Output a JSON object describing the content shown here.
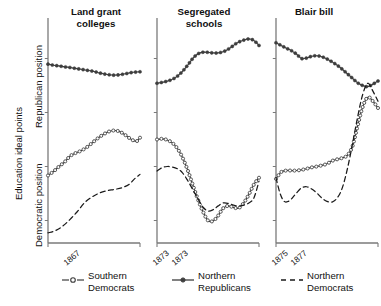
{
  "axis": {
    "outer_ylabel": "Education ideal points",
    "upper_ylabel": "Republican position",
    "lower_ylabel": "Democratic position"
  },
  "legend": {
    "items": [
      {
        "label": "Southern\nDemocrats",
        "style": "line-open-circle",
        "color": "#3d3d3d"
      },
      {
        "label": "Northern\nRepublicans",
        "style": "line-filled-circle",
        "color": "#3d3d3d"
      },
      {
        "label": "Northern\nDemocrats",
        "style": "dashed",
        "color": "#1a1a1a"
      }
    ]
  },
  "panels": [
    {
      "title": "Land grant\ncolleges",
      "xticks": [
        "1867",
        "1873"
      ]
    },
    {
      "title": "Segregated\nschools",
      "xticks": [
        "1873",
        "1875"
      ]
    },
    {
      "title": "Blair bill",
      "xticks": [
        "1877",
        "1890"
      ]
    }
  ],
  "chart_data": {
    "type": "line",
    "title": "",
    "subtitle": "",
    "xlabel": "",
    "ylabel": "Education ideal points",
    "ylim": [
      0,
      1
    ],
    "grid": false,
    "legend_position": "bottom",
    "panel_layout": "1x3 small multiples",
    "y_axis_note": "Upper half labeled 'Republican position', lower half labeled 'Democratic position'; no numeric tick labels shown",
    "panels": [
      {
        "name": "Land grant colleges",
        "xlim": [
          "1867",
          "1873"
        ],
        "xticks": [
          "1867",
          "1873"
        ],
        "series": [
          {
            "name": "Northern Republicans",
            "style": "line-filled-circle",
            "x": [
              0,
              0.06,
              0.12,
              0.18,
              0.24,
              0.3,
              0.36,
              0.42,
              0.48,
              0.54,
              0.6,
              0.66,
              0.72,
              0.78,
              0.84,
              0.9,
              0.96,
              1
            ],
            "values": [
              0.795,
              0.79,
              0.787,
              0.783,
              0.78,
              0.776,
              0.772,
              0.768,
              0.764,
              0.758,
              0.752,
              0.748,
              0.746,
              0.748,
              0.752,
              0.757,
              0.76,
              0.761
            ]
          },
          {
            "name": "Southern Democrats",
            "style": "line-open-circle",
            "x": [
              0,
              0.06,
              0.12,
              0.18,
              0.24,
              0.3,
              0.36,
              0.42,
              0.48,
              0.54,
              0.6,
              0.66,
              0.72,
              0.78,
              0.84,
              0.9,
              0.96,
              1
            ],
            "values": [
              0.3,
              0.318,
              0.34,
              0.36,
              0.386,
              0.4,
              0.41,
              0.425,
              0.445,
              0.465,
              0.482,
              0.495,
              0.5,
              0.495,
              0.48,
              0.462,
              0.452,
              0.468
            ]
          },
          {
            "name": "Northern Democrats",
            "style": "dashed",
            "x": [
              0,
              0.08,
              0.16,
              0.24,
              0.32,
              0.4,
              0.48,
              0.56,
              0.64,
              0.72,
              0.8,
              0.88,
              0.94,
              1
            ],
            "values": [
              0.045,
              0.055,
              0.075,
              0.105,
              0.14,
              0.18,
              0.205,
              0.222,
              0.232,
              0.238,
              0.245,
              0.26,
              0.285,
              0.305
            ]
          }
        ]
      },
      {
        "name": "Segregated schools",
        "xlim": [
          "1873",
          "1875"
        ],
        "xticks": [
          "1873",
          "1875"
        ],
        "series": [
          {
            "name": "Northern Republicans",
            "style": "line-filled-circle",
            "x": [
              0,
              0.06,
              0.12,
              0.18,
              0.24,
              0.3,
              0.36,
              0.42,
              0.48,
              0.54,
              0.6,
              0.66,
              0.72,
              0.78,
              0.84,
              0.9,
              0.95,
              1
            ],
            "values": [
              0.71,
              0.715,
              0.722,
              0.735,
              0.758,
              0.79,
              0.825,
              0.845,
              0.848,
              0.845,
              0.845,
              0.852,
              0.868,
              0.888,
              0.9,
              0.907,
              0.9,
              0.878
            ]
          },
          {
            "name": "Southern Democrats",
            "style": "line-open-circle",
            "x": [
              0,
              0.05,
              0.1,
              0.15,
              0.2,
              0.25,
              0.3,
              0.35,
              0.4,
              0.45,
              0.5,
              0.55,
              0.6,
              0.65,
              0.7,
              0.75,
              0.8,
              0.85,
              0.9,
              0.95,
              1
            ],
            "values": [
              0.46,
              0.463,
              0.458,
              0.445,
              0.42,
              0.38,
              0.325,
              0.26,
              0.195,
              0.14,
              0.1,
              0.098,
              0.122,
              0.155,
              0.165,
              0.158,
              0.155,
              0.178,
              0.215,
              0.26,
              0.29
            ]
          },
          {
            "name": "Northern Democrats",
            "style": "dashed",
            "x": [
              0,
              0.05,
              0.1,
              0.15,
              0.2,
              0.25,
              0.3,
              0.35,
              0.4,
              0.45,
              0.5,
              0.55,
              0.6,
              0.65,
              0.7,
              0.75,
              0.8,
              0.85,
              0.9,
              0.95,
              1
            ],
            "values": [
              0.32,
              0.335,
              0.34,
              0.338,
              0.33,
              0.312,
              0.278,
              0.238,
              0.198,
              0.16,
              0.142,
              0.148,
              0.165,
              0.178,
              0.176,
              0.168,
              0.164,
              0.168,
              0.178,
              0.2,
              0.275
            ]
          }
        ]
      },
      {
        "name": "Blair bill",
        "xlim": [
          "1877",
          "1890"
        ],
        "xticks": [
          "1877",
          "1890"
        ],
        "series": [
          {
            "name": "Northern Republicans",
            "style": "line-filled-circle",
            "x": [
              0,
              0.05,
              0.1,
              0.15,
              0.2,
              0.25,
              0.3,
              0.35,
              0.4,
              0.45,
              0.5,
              0.55,
              0.6,
              0.65,
              0.7,
              0.75,
              0.8,
              0.85,
              0.9,
              0.95,
              1
            ],
            "values": [
              0.89,
              0.878,
              0.866,
              0.855,
              0.84,
              0.82,
              0.822,
              0.83,
              0.832,
              0.828,
              0.818,
              0.805,
              0.79,
              0.772,
              0.752,
              0.732,
              0.712,
              0.7,
              0.695,
              0.706,
              0.72
            ]
          },
          {
            "name": "Southern Democrats",
            "style": "line-open-circle",
            "x": [
              0,
              0.05,
              0.1,
              0.15,
              0.2,
              0.25,
              0.3,
              0.35,
              0.4,
              0.45,
              0.5,
              0.55,
              0.6,
              0.65,
              0.7,
              0.75,
              0.8,
              0.85,
              0.9,
              0.95,
              1
            ],
            "values": [
              0.285,
              0.315,
              0.322,
              0.322,
              0.322,
              0.325,
              0.33,
              0.336,
              0.34,
              0.345,
              0.352,
              0.365,
              0.372,
              0.378,
              0.39,
              0.43,
              0.52,
              0.605,
              0.648,
              0.63,
              0.6
            ]
          },
          {
            "name": "Northern Democrats",
            "style": "dashed",
            "x": [
              0,
              0.04,
              0.08,
              0.12,
              0.16,
              0.2,
              0.25,
              0.3,
              0.35,
              0.4,
              0.45,
              0.5,
              0.55,
              0.6,
              0.65,
              0.7,
              0.75,
              0.8,
              0.85,
              0.9,
              0.95,
              1
            ],
            "values": [
              0.29,
              0.22,
              0.185,
              0.185,
              0.2,
              0.222,
              0.245,
              0.25,
              0.24,
              0.222,
              0.2,
              0.185,
              0.182,
              0.2,
              0.245,
              0.33,
              0.44,
              0.56,
              0.66,
              0.71,
              0.675,
              0.63
            ]
          }
        ]
      }
    ]
  }
}
